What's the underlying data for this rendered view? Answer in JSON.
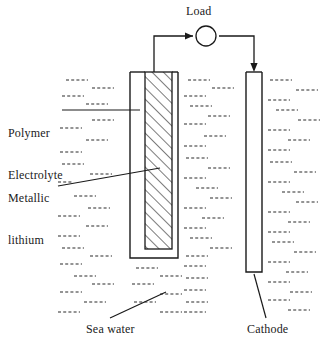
{
  "figure": {
    "width": 330,
    "height": 344,
    "background_color": "#ffffff",
    "line_color": "#1a1a1a"
  },
  "labels": {
    "load": "Load",
    "polymer_electrolyte_line1": "Polymer",
    "polymer_electrolyte_line2": "Electrolyte",
    "metallic_lithium_line1": "Metallic",
    "metallic_lithium_line2": "lithium",
    "sea_water": "Sea water",
    "cathode": "Cathode"
  },
  "components": {
    "load_symbol": "circle",
    "anode_fill": "diagonal-hatch",
    "electrolyte_medium": "dashed-line-field",
    "current_direction": "left-to-right"
  },
  "geometry": {
    "load_circle": {
      "cx": 206,
      "cy": 36,
      "r": 10
    },
    "anode_outer": {
      "x": 130,
      "y": 72,
      "width": 48,
      "height": 186
    },
    "anode_hatch": {
      "x": 145,
      "y": 77,
      "width": 27,
      "height": 172
    },
    "cathode": {
      "x": 246,
      "y": 72,
      "width": 16,
      "height": 200
    },
    "wire_left_x": 154,
    "wire_right_x": 254,
    "wire_top_y": 36
  },
  "seawater_field": {
    "dash_rows": 19,
    "dash_segment_width": 22,
    "dash_pattern": "3 2",
    "description": "staggered short dashed segments filling the tank"
  }
}
